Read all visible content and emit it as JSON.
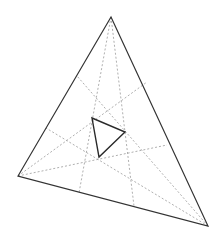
{
  "diagram": {
    "type": "geometry",
    "colors": {
      "background": "#ffffff",
      "outer_triangle": "#333333",
      "inner_triangle": "#2a2a2a",
      "trisectors": "#9a9a9a"
    },
    "outer_triangle": {
      "vertices": {
        "A": [
          111,
          17
        ],
        "B": [
          18,
          176
        ],
        "C": [
          208,
          226
        ]
      }
    },
    "inner_triangle": {
      "vertices": {
        "P": [
          92,
          118
        ],
        "Q": [
          125,
          132
        ],
        "R": [
          99,
          157
        ]
      }
    },
    "trisectors": [
      {
        "from": "A",
        "start": [
          111,
          17
        ],
        "end": [
          79,
          193
        ]
      },
      {
        "from": "A",
        "start": [
          111,
          17
        ],
        "end": [
          134,
          206
        ]
      },
      {
        "from": "B",
        "start": [
          18,
          176
        ],
        "end": [
          147,
          82
        ]
      },
      {
        "from": "B",
        "start": [
          18,
          176
        ],
        "end": [
          167,
          145
        ]
      },
      {
        "from": "C",
        "start": [
          208,
          226
        ],
        "end": [
          77,
          76
        ]
      },
      {
        "from": "C",
        "start": [
          208,
          226
        ],
        "end": [
          46,
          128
        ]
      }
    ]
  }
}
